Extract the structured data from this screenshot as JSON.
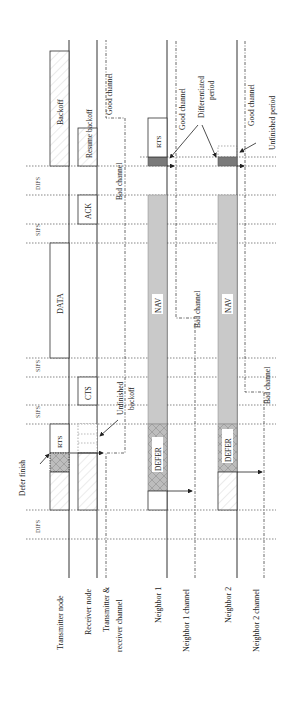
{
  "lanes": [
    {
      "id": "transmitter",
      "label": "Transmitter node"
    },
    {
      "id": "receiver",
      "label": "Receiver node"
    },
    {
      "id": "tr_channel",
      "label_line1": "Transmitter &",
      "label_line2": "receiver channel"
    },
    {
      "id": "neighbor1",
      "label": "Neighbor 1"
    },
    {
      "id": "neighbor1_channel",
      "label": "Neighbor 1 channel"
    },
    {
      "id": "neighbor2",
      "label": "Neighbor 2"
    },
    {
      "id": "neighbor2_channel",
      "label": "Neighbor 2 channel"
    }
  ],
  "intervals": {
    "difs_start": "DIFS",
    "sifs_1": "SIFS",
    "sifs_2": "SIFS",
    "sifs_3": "SIFS",
    "difs_end": "DIFS"
  },
  "frames": {
    "rts": "RTS",
    "cts": "CTS",
    "data": "DATA",
    "ack": "ACK",
    "backoff": "Backoff",
    "resume_backoff": "Resume backoff",
    "n1_defer": "DEFER",
    "n1_nav": "NAV",
    "n1_rts": "RTS",
    "n2_defer": "DEFER",
    "n2_nav": "NAV"
  },
  "annotations": {
    "defer_finish": "Defer finish",
    "unfinished_backoff_1": "Unfinished",
    "unfinished_backoff_2": "backoff",
    "tr_good_channel": "Good channel",
    "tr_bad_channel": "Bad channel",
    "n1_bad_channel": "Bad channel",
    "n1_good_channel": "Good channel",
    "n2_bad_channel": "Bad channel",
    "n2_good_channel": "Good channel",
    "differentiated_1": "Differentiated",
    "differentiated_2": "period",
    "unfinished_period": "Unfinished period"
  }
}
